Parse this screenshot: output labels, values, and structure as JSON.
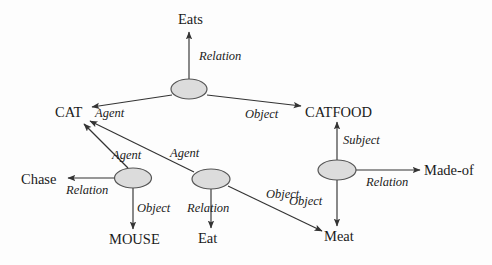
{
  "diagram": {
    "background_color": "#fdfdfd",
    "node_fill_color": "#dcdcdc",
    "node_stroke_color": "#555555",
    "edge_color": "#333333",
    "text_color": "#1b1b1b",
    "concepts": [
      {
        "id": "eats",
        "label": "Eats",
        "x": 189,
        "y": 19
      },
      {
        "id": "cat",
        "label": "CAT",
        "x": 71,
        "y": 112
      },
      {
        "id": "catfood",
        "label": "CATFOOD",
        "x": 340,
        "y": 112
      },
      {
        "id": "chase",
        "label": "Chase",
        "x": 43,
        "y": 179
      },
      {
        "id": "made-of",
        "label": "Made-of",
        "x": 451,
        "y": 170
      },
      {
        "id": "mouse",
        "label": "MOUSE",
        "x": 136,
        "y": 239
      },
      {
        "id": "eat",
        "label": "Eat",
        "x": 210,
        "y": 238
      },
      {
        "id": "meat",
        "label": "Meat",
        "x": 341,
        "y": 236
      }
    ],
    "relation_nodes": [
      {
        "id": "node-eats",
        "cx": 189,
        "cy": 89,
        "rx": 18,
        "ry": 10
      },
      {
        "id": "node-chase",
        "cx": 133,
        "cy": 178,
        "rx": 18.5,
        "ry": 10
      },
      {
        "id": "node-eat",
        "cx": 211,
        "cy": 179,
        "rx": 19,
        "ry": 10
      },
      {
        "id": "node-madeof",
        "cx": 337,
        "cy": 170,
        "rx": 19,
        "ry": 10
      }
    ],
    "edges": [
      {
        "id": "edge-eats-relation",
        "label": "Relation",
        "label_x": 199,
        "label_y": 50,
        "from": "node-eats",
        "to": "eats"
      },
      {
        "id": "edge-eats-agent",
        "label": "Agent",
        "label_x": 95,
        "label_y": 112,
        "from": "node-eats",
        "to": "cat"
      },
      {
        "id": "edge-eats-object",
        "label": "Object",
        "label_x": 245,
        "label_y": 113,
        "from": "node-eats",
        "to": "catfood"
      },
      {
        "id": "edge-chase-agent",
        "label": "Agent",
        "label_x": 115,
        "label_y": 155,
        "from": "node-chase",
        "to": "cat"
      },
      {
        "id": "edge-chase-relation",
        "label": "Relation",
        "label_x": 67,
        "label_y": 190,
        "from": "node-chase",
        "to": "chase"
      },
      {
        "id": "edge-chase-object",
        "label": "Object",
        "label_x": 138,
        "label_y": 208,
        "from": "node-chase",
        "to": "mouse"
      },
      {
        "id": "edge-eat-agent",
        "label": "Agent",
        "label_x": 172,
        "label_y": 152,
        "from": "node-eat",
        "to": "cat"
      },
      {
        "id": "edge-eat-relation",
        "label": "Relation",
        "label_x": 188,
        "label_y": 208,
        "from": "node-eat",
        "to": "eat"
      },
      {
        "id": "edge-eat-object",
        "label": "Object",
        "label_x": 268,
        "label_y": 194,
        "from": "node-eat",
        "to": "meat"
      },
      {
        "id": "edge-madeof-subject",
        "label": "Subject",
        "label_x": 344,
        "label_y": 140,
        "from": "catfood",
        "to": "node-madeof"
      },
      {
        "id": "edge-madeof-relation",
        "label": "Relation",
        "label_x": 367,
        "label_y": 182,
        "from": "node-madeof",
        "to": "made-of"
      },
      {
        "id": "edge-madeof-object",
        "label": "Object",
        "label_x": 291,
        "label_y": 201,
        "from": "node-madeof",
        "to": "meat"
      }
    ]
  }
}
